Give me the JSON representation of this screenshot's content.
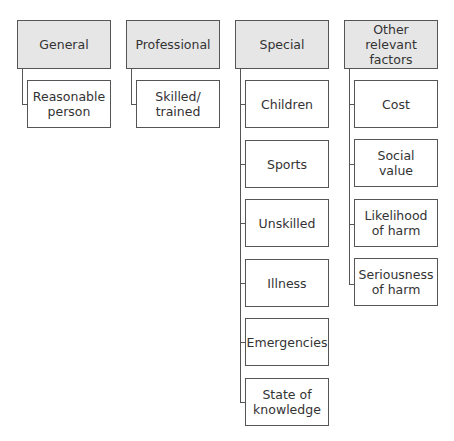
{
  "diagram": {
    "columns": [
      {
        "header": "General",
        "items": [
          "Reasonable person"
        ]
      },
      {
        "header": "Professional",
        "items": [
          "Skilled/ trained"
        ]
      },
      {
        "header": "Special",
        "items": [
          "Children",
          "Sports",
          "Unskilled",
          "Illness",
          "Emergencies",
          "State of knowledge"
        ]
      },
      {
        "header": "Other relevant factors",
        "items": [
          "Cost",
          "Social value",
          "Likelihood of harm",
          "Seriousness of harm"
        ]
      }
    ],
    "colors": {
      "header_fill": "#e6e6e6",
      "border": "#555555",
      "item_fill": "#ffffff"
    }
  }
}
